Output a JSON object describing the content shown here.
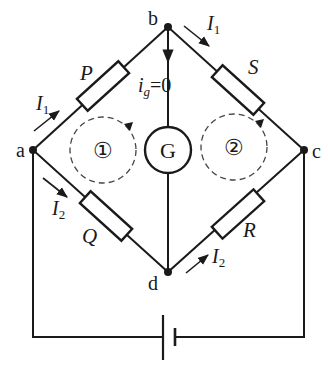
{
  "diagram": {
    "type": "Wheatstone bridge circuit",
    "nodes": [
      {
        "id": "a",
        "label": "a",
        "x": 33,
        "y": 150
      },
      {
        "id": "b",
        "label": "b",
        "x": 168,
        "y": 27
      },
      {
        "id": "c",
        "label": "c",
        "x": 304,
        "y": 150
      },
      {
        "id": "d",
        "label": "d",
        "x": 168,
        "y": 272
      }
    ],
    "resistors": [
      {
        "id": "P",
        "label": "P",
        "between": [
          "a",
          "b"
        ]
      },
      {
        "id": "S",
        "label": "S",
        "between": [
          "b",
          "c"
        ]
      },
      {
        "id": "Q",
        "label": "Q",
        "between": [
          "a",
          "d"
        ]
      },
      {
        "id": "R",
        "label": "R",
        "between": [
          "d",
          "c"
        ]
      }
    ],
    "galvanometer": {
      "label": "G",
      "between": [
        "b",
        "d"
      ]
    },
    "galvanometer_current": {
      "symbol": "i",
      "subscript": "g",
      "value_text": "=0"
    },
    "currents": [
      {
        "symbol": "I",
        "subscript": "1",
        "branch": "a-b"
      },
      {
        "symbol": "I",
        "subscript": "1",
        "branch": "b-c"
      },
      {
        "symbol": "I",
        "subscript": "2",
        "branch": "a-d"
      },
      {
        "symbol": "I",
        "subscript": "2",
        "branch": "d-c"
      }
    ],
    "loops": [
      {
        "label": "①",
        "direction": "clockwise"
      },
      {
        "label": "②",
        "direction": "clockwise"
      }
    ],
    "source": {
      "type": "battery",
      "between": [
        "a",
        "c"
      ]
    }
  }
}
